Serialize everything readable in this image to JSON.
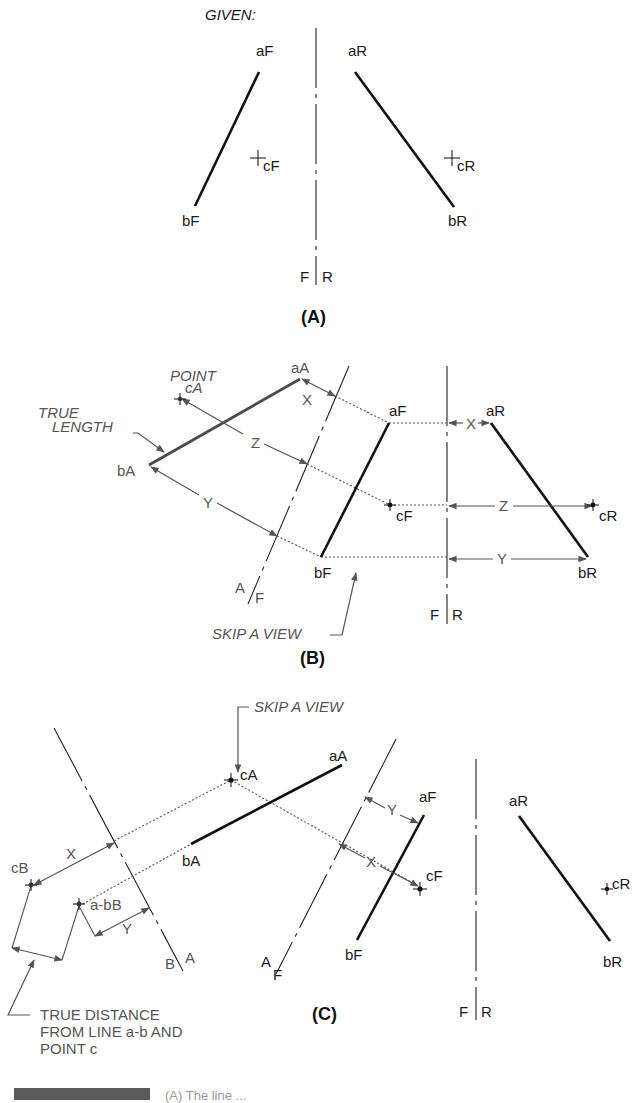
{
  "panel_a": {
    "given": "GIVEN:",
    "aF": "aF",
    "aR": "aR",
    "bF": "bF",
    "bR": "bR",
    "cF": "cF",
    "cR": "cR",
    "fold_F": "F",
    "fold_R": "R",
    "caption": "(A)"
  },
  "panel_b": {
    "point_label": "POINT",
    "cA": "cA",
    "true_length_1": "TRUE",
    "true_length_2": "LENGTH",
    "aA": "aA",
    "bA": "bA",
    "aF": "aF",
    "bF": "bF",
    "cF": "cF",
    "aR": "aR",
    "bR": "bR",
    "cR": "cR",
    "dim_x": "X",
    "dim_y": "Y",
    "dim_z": "Z",
    "fold_A": "A",
    "fold_F": "F",
    "fold_F2": "F",
    "fold_R2": "R",
    "skip_a_view": "SKIP A VIEW",
    "caption": "(B)"
  },
  "panel_c": {
    "skip_a_view": "SKIP A VIEW",
    "cA": "cA",
    "aA": "aA",
    "bA": "bA",
    "cB": "cB",
    "abB": "a-bB",
    "aF": "aF",
    "bF": "bF",
    "cF": "cF",
    "aR": "aR",
    "bR": "bR",
    "cR": "cR",
    "dim_x": "X",
    "dim_y": "Y",
    "fold_B": "B",
    "fold_A": "A",
    "fold_A2": "A",
    "fold_F2": "F",
    "fold_F3": "F",
    "fold_R3": "R",
    "true_distance_1": "TRUE DISTANCE",
    "true_distance_2": "FROM LINE a-b AND",
    "true_distance_3": "POINT c",
    "caption": "(C)"
  },
  "footer": {
    "caption_fragment": "(A) The line ..."
  }
}
